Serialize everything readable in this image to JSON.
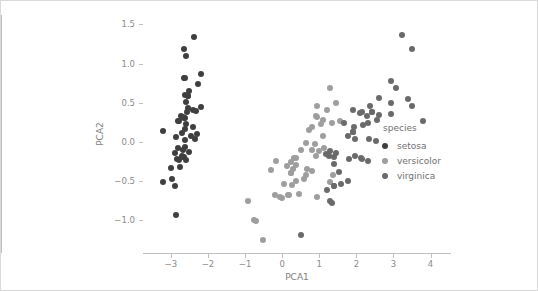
{
  "chart_data": {
    "type": "scatter",
    "title": "",
    "xlabel": "PCA1",
    "ylabel": "PCA2",
    "xlim": [
      -3.75,
      4.55
    ],
    "ylim": [
      -1.42,
      1.62
    ],
    "xticks": [
      -3,
      -2,
      -1,
      0,
      1,
      2,
      3,
      4
    ],
    "xticklabels": [
      "−3",
      "−2",
      "−1",
      "0",
      "1",
      "2",
      "3",
      "4"
    ],
    "yticks": [
      -1.0,
      -0.5,
      0.0,
      0.5,
      1.0,
      1.5
    ],
    "yticklabels": [
      "−1.0",
      "−0.5",
      "0.0",
      "0.5",
      "1.0",
      "1.5"
    ],
    "grid": false,
    "legend": {
      "title": "species",
      "position": "right",
      "entries": [
        {
          "name": "setosa",
          "color": "#3f3f3f"
        },
        {
          "name": "versicolor",
          "color": "#9e9e9e"
        },
        {
          "name": "virginica",
          "color": "#6a6a6a"
        }
      ]
    },
    "marker_size_px": 6,
    "series": [
      {
        "name": "setosa",
        "color": "#3f3f3f",
        "points": [
          [
            -2.68,
            0.32
          ],
          [
            -2.71,
            -0.18
          ],
          [
            -2.89,
            -0.14
          ],
          [
            -2.75,
            -0.32
          ],
          [
            -2.73,
            0.33
          ],
          [
            -2.28,
            0.74
          ],
          [
            -2.82,
            -0.08
          ],
          [
            -2.62,
            0.17
          ],
          [
            -2.88,
            -0.57
          ],
          [
            -2.67,
            -0.11
          ],
          [
            -2.5,
            0.65
          ],
          [
            -2.61,
            0.02
          ],
          [
            -2.78,
            -0.23
          ],
          [
            -3.22,
            -0.51
          ],
          [
            -2.64,
            1.18
          ],
          [
            -2.38,
            1.34
          ],
          [
            -2.62,
            0.81
          ],
          [
            -2.64,
            0.31
          ],
          [
            -2.2,
            0.87
          ],
          [
            -2.59,
            0.51
          ],
          [
            -2.31,
            0.39
          ],
          [
            -2.54,
            0.43
          ],
          [
            -3.21,
            0.14
          ],
          [
            -2.3,
            0.1
          ],
          [
            -2.35,
            0.04
          ],
          [
            -2.5,
            -0.13
          ],
          [
            -2.46,
            0.08
          ],
          [
            -2.56,
            0.38
          ],
          [
            -2.63,
            0.3
          ],
          [
            -2.64,
            -0.19
          ],
          [
            -2.59,
            -0.23
          ],
          [
            -2.4,
            0.41
          ],
          [
            -2.64,
            0.81
          ],
          [
            -2.59,
            1.09
          ],
          [
            -2.63,
            -0.07
          ],
          [
            -2.86,
            0.06
          ],
          [
            -2.62,
            0.6
          ],
          [
            -2.8,
            0.27
          ],
          [
            -2.98,
            -0.48
          ],
          [
            -2.59,
            0.23
          ],
          [
            -2.77,
            0.26
          ],
          [
            -2.85,
            -0.93
          ],
          [
            -2.99,
            -0.33
          ],
          [
            -2.4,
            0.19
          ],
          [
            -2.2,
            0.44
          ],
          [
            -2.71,
            -0.2
          ],
          [
            -2.54,
            0.59
          ],
          [
            -2.84,
            -0.22
          ],
          [
            -2.54,
            0.58
          ],
          [
            -2.7,
            0.11
          ]
        ]
      },
      {
        "name": "versicolor",
        "color": "#9e9e9e",
        "points": [
          [
            1.28,
            0.69
          ],
          [
            0.93,
            0.32
          ],
          [
            1.46,
            0.5
          ],
          [
            0.18,
            -0.68
          ],
          [
            1.09,
            0.07
          ],
          [
            0.64,
            -0.42
          ],
          [
            1.1,
            0.28
          ],
          [
            -0.75,
            -1.0
          ],
          [
            1.04,
            0.23
          ],
          [
            -0.01,
            -0.72
          ],
          [
            -0.51,
            -1.26
          ],
          [
            0.51,
            -0.1
          ],
          [
            0.26,
            -0.55
          ],
          [
            0.98,
            -0.12
          ],
          [
            -0.17,
            -0.25
          ],
          [
            0.93,
            0.46
          ],
          [
            0.66,
            -0.35
          ],
          [
            0.23,
            -0.4
          ],
          [
            0.94,
            -0.7
          ],
          [
            0.04,
            -0.54
          ],
          [
            1.12,
            -0.08
          ],
          [
            0.36,
            -0.21
          ],
          [
            1.3,
            -0.51
          ],
          [
            0.92,
            -0.18
          ],
          [
            0.71,
            0.15
          ],
          [
            0.9,
            0.33
          ],
          [
            1.33,
            0.24
          ],
          [
            1.56,
            0.27
          ],
          [
            0.81,
            -0.11
          ],
          [
            -0.31,
            -0.36
          ],
          [
            -0.07,
            -0.7
          ],
          [
            -0.19,
            -0.68
          ],
          [
            0.13,
            -0.31
          ],
          [
            1.38,
            -0.42
          ],
          [
            0.59,
            -0.48
          ],
          [
            0.81,
            0.19
          ],
          [
            1.22,
            0.41
          ],
          [
            0.81,
            -0.37
          ],
          [
            0.25,
            -0.26
          ],
          [
            0.16,
            -0.68
          ],
          [
            0.46,
            -0.67
          ],
          [
            0.89,
            -0.03
          ],
          [
            0.23,
            -0.4
          ],
          [
            -0.71,
            -1.01
          ],
          [
            0.36,
            -0.5
          ],
          [
            0.33,
            -0.21
          ],
          [
            0.37,
            -0.29
          ],
          [
            0.64,
            -0.02
          ],
          [
            -0.91,
            -0.75
          ],
          [
            0.3,
            -0.35
          ]
        ]
      },
      {
        "name": "virginica",
        "color": "#6a6a6a",
        "points": [
          [
            2.53,
            0.01
          ],
          [
            1.41,
            -0.57
          ],
          [
            2.62,
            0.34
          ],
          [
            1.97,
            -0.18
          ],
          [
            2.35,
            0.04
          ],
          [
            3.4,
            0.55
          ],
          [
            0.52,
            -1.19
          ],
          [
            2.93,
            0.36
          ],
          [
            2.32,
            -0.24
          ],
          [
            2.92,
            0.78
          ],
          [
            1.66,
            0.24
          ],
          [
            1.8,
            -0.22
          ],
          [
            2.17,
            0.21
          ],
          [
            1.34,
            -0.78
          ],
          [
            1.59,
            -0.54
          ],
          [
            1.9,
            0.12
          ],
          [
            1.95,
            0.04
          ],
          [
            3.49,
            1.18
          ],
          [
            3.79,
            0.26
          ],
          [
            1.3,
            -0.76
          ],
          [
            2.43,
            0.38
          ],
          [
            1.2,
            -0.61
          ],
          [
            3.5,
            0.46
          ],
          [
            1.39,
            -0.2
          ],
          [
            2.28,
            0.33
          ],
          [
            2.61,
            0.56
          ],
          [
            1.26,
            -0.18
          ],
          [
            1.29,
            -0.12
          ],
          [
            2.12,
            -0.21
          ],
          [
            2.38,
            0.46
          ],
          [
            2.94,
            0.49
          ],
          [
            3.23,
            1.37
          ],
          [
            2.15,
            -0.22
          ],
          [
            1.44,
            -0.14
          ],
          [
            1.78,
            -0.5
          ],
          [
            3.07,
            0.69
          ],
          [
            2.14,
            0.38
          ],
          [
            1.9,
            0.12
          ],
          [
            1.17,
            -0.16
          ],
          [
            2.11,
            0.37
          ],
          [
            2.31,
            0.24
          ],
          [
            1.92,
            0.41
          ],
          [
            1.41,
            -0.57
          ],
          [
            2.56,
            0.28
          ],
          [
            2.42,
            0.38
          ],
          [
            1.94,
            0.19
          ],
          [
            1.53,
            -0.38
          ],
          [
            1.77,
            0.08
          ],
          [
            1.9,
            0.12
          ],
          [
            1.39,
            -0.28
          ]
        ]
      }
    ]
  }
}
